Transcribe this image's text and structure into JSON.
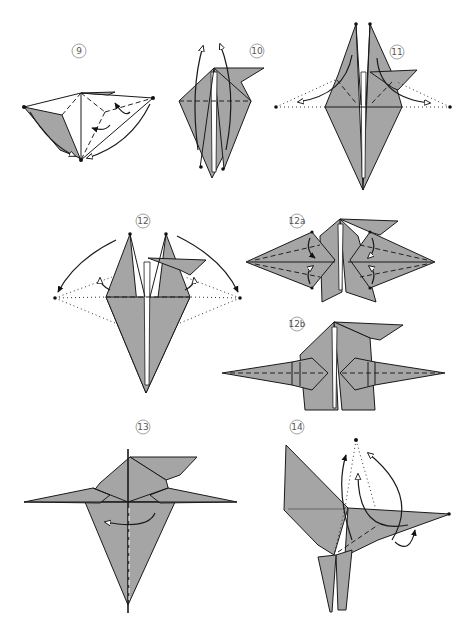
{
  "diagram": {
    "colors": {
      "paper": "#a5a5a5",
      "line": "#1a1a1a",
      "background": "#ffffff",
      "step_label": "#555555"
    },
    "steps": [
      {
        "id": "9",
        "label": "9",
        "description": "Open model, collapse side points down to bottom point"
      },
      {
        "id": "10",
        "label": "10",
        "description": "Fold the inner flaps up along the horizontal valley line"
      },
      {
        "id": "11",
        "label": "11",
        "description": "Inside-reverse-fold the two upper points out to the sides"
      },
      {
        "id": "12",
        "label": "12",
        "description": "Swing points down to the sides"
      },
      {
        "id": "12a",
        "label": "12a",
        "description": "Narrow the side points with valley folds"
      },
      {
        "id": "12b",
        "label": "12b",
        "description": "Result of narrowing the side points"
      },
      {
        "id": "13",
        "label": "13",
        "description": "Fold model in half along the center"
      },
      {
        "id": "14",
        "label": "14",
        "description": "Reverse-fold the point upward to form the head"
      }
    ],
    "legend": {
      "valley_fold": "dashed line",
      "mountain_fold": "dash-dot line",
      "existing_crease": "dotted line",
      "fold_arrow": "curved arrow"
    }
  }
}
